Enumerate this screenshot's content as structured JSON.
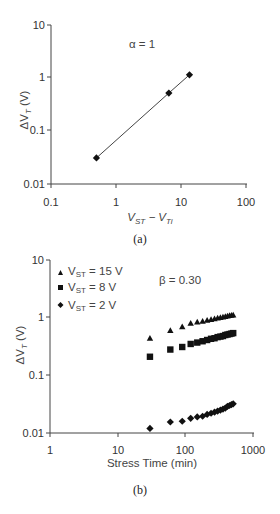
{
  "chart_data": [
    {
      "type": "scatter",
      "panel": "(a)",
      "title": "",
      "annotation": "α = 1",
      "xlabel": "V_ST − V_Ti",
      "ylabel": "ΔV_T (V)",
      "xscale": "log",
      "yscale": "log",
      "xlim": [
        0.1,
        100
      ],
      "ylim": [
        0.01,
        10
      ],
      "xticks": [
        "0.1",
        "1",
        "10",
        "100"
      ],
      "yticks": [
        "0.01",
        "0.1",
        "1",
        "10"
      ],
      "grid": false,
      "series": [
        {
          "name": "data",
          "marker": "diamond",
          "line": true,
          "x": [
            0.5,
            6.5,
            13.5
          ],
          "y": [
            0.031,
            0.52,
            1.15
          ]
        }
      ]
    },
    {
      "type": "scatter",
      "panel": "(b)",
      "title": "",
      "annotation": "β = 0.30",
      "xlabel": "Stress Time (min)",
      "ylabel": "ΔV_T (V)",
      "xscale": "log",
      "yscale": "log",
      "xlim": [
        1,
        1000
      ],
      "ylim": [
        0.01,
        10
      ],
      "xticks": [
        "1",
        "10",
        "100",
        "1000"
      ],
      "yticks": [
        "0.01",
        "0.1",
        "1",
        "10"
      ],
      "grid": false,
      "legend_position": "upper-left",
      "series": [
        {
          "name": "V_ST = 15 V",
          "marker": "triangle",
          "x": [
            30,
            60,
            90,
            120,
            150,
            180,
            210,
            240,
            270,
            300,
            330,
            360,
            390,
            420,
            450,
            480,
            510
          ],
          "y": [
            0.44,
            0.6,
            0.7,
            0.8,
            0.84,
            0.87,
            0.9,
            0.93,
            0.96,
            0.99,
            1.01,
            1.03,
            1.05,
            1.07,
            1.09,
            1.1,
            1.12
          ]
        },
        {
          "name": "V_ST = 8 V",
          "marker": "square",
          "x": [
            30,
            60,
            90,
            120,
            150,
            180,
            210,
            240,
            270,
            300,
            330,
            360,
            390,
            420,
            450,
            480,
            510
          ],
          "y": [
            0.21,
            0.28,
            0.31,
            0.35,
            0.37,
            0.39,
            0.41,
            0.43,
            0.44,
            0.46,
            0.47,
            0.48,
            0.5,
            0.51,
            0.52,
            0.53,
            0.54
          ]
        },
        {
          "name": "V_ST = 2 V",
          "marker": "diamond",
          "x": [
            30,
            60,
            90,
            120,
            150,
            180,
            210,
            240,
            270,
            300,
            330,
            360,
            390,
            420,
            450,
            480,
            510
          ],
          "y": [
            0.012,
            0.0155,
            0.016,
            0.018,
            0.019,
            0.0195,
            0.021,
            0.022,
            0.023,
            0.024,
            0.025,
            0.026,
            0.027,
            0.029,
            0.03,
            0.031,
            0.032
          ]
        }
      ]
    }
  ],
  "labels": {
    "a": {
      "annotation": "α = 1",
      "caption": "(a)",
      "ylabel_main": "ΔV",
      "ylabel_sub": "T",
      "ylabel_tail": " (V)",
      "xlabel_v1": "V",
      "xlabel_s1": "ST",
      "xlabel_mid": " − V",
      "xlabel_s2": "Ti",
      "xticks": [
        "0.1",
        "1",
        "10",
        "100"
      ],
      "yticks": [
        "10",
        "1",
        "0.1",
        "0.01"
      ]
    },
    "b": {
      "annotation": "β = 0.30",
      "caption": "(b)",
      "ylabel_main": "ΔV",
      "ylabel_sub": "T",
      "ylabel_tail": " (V)",
      "xlabel": "Stress Time (min)",
      "xticks": [
        "1",
        "10",
        "100",
        "1000"
      ],
      "yticks": [
        "10",
        "1",
        "0.1",
        "0.01"
      ],
      "legend": [
        {
          "v": "V",
          "sub": "ST",
          "rest": " = 15 V"
        },
        {
          "v": "V",
          "sub": "ST",
          "rest": " = 8 V"
        },
        {
          "v": "V",
          "sub": "ST",
          "rest": " = 2 V"
        }
      ]
    }
  }
}
